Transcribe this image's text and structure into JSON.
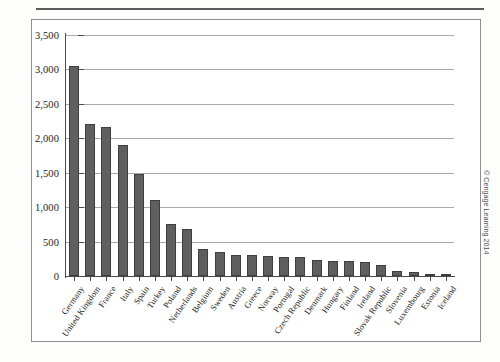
{
  "figure": {
    "credit": "© Cengage Learning 2014"
  },
  "chart_data": {
    "type": "bar",
    "title": "",
    "subtitle": "",
    "xlabel": "",
    "ylabel": "",
    "ylim": [
      0,
      3500
    ],
    "ytick_labels": [
      "3,500",
      "3,000",
      "2,500",
      "2,000",
      "1,500",
      "1,000",
      "500",
      "0"
    ],
    "ytick_values": [
      3500,
      3000,
      2500,
      2000,
      1500,
      1000,
      500,
      0
    ],
    "grid": true,
    "legend": "none",
    "categories": [
      "Germany",
      "United Kingdom",
      "France",
      "Italy",
      "Spain",
      "Turkey",
      "Poland",
      "Netherlands",
      "Belgium",
      "Sweden",
      "Austria",
      "Greece",
      "Norway",
      "Portugal",
      "Czech Republic",
      "Denmark",
      "Hungary",
      "Finland",
      "Ireland",
      "Slovak Republic",
      "Slovenia",
      "Luxembourg",
      "Estonia",
      "Iceland"
    ],
    "values": [
      3050,
      2210,
      2170,
      1900,
      1480,
      1110,
      750,
      690,
      390,
      350,
      310,
      300,
      285,
      275,
      275,
      235,
      225,
      220,
      205,
      165,
      70,
      55,
      22,
      12
    ]
  }
}
